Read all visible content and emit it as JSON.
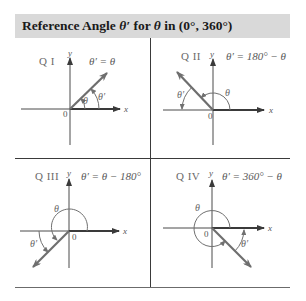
{
  "header": {
    "title_prefix": "Reference Angle ",
    "title_theta_prime": "θ′",
    "title_mid": " for ",
    "title_theta": "θ",
    "title_suffix": " in (0°, 360°)",
    "background": "#d9d9d9"
  },
  "panels": [
    {
      "id": "q1",
      "quadrant_label": "Q I",
      "formula": "θ′ = θ",
      "axis_x": "x",
      "axis_y": "y",
      "origin": "0",
      "angle_label": "θ",
      "ref_angle_label": "θ′"
    },
    {
      "id": "q2",
      "quadrant_label": "Q II",
      "formula": "θ′ = 180° − θ",
      "axis_x": "x",
      "axis_y": "y",
      "origin": "0",
      "angle_label": "θ",
      "ref_angle_label": "θ′"
    },
    {
      "id": "q3",
      "quadrant_label": "Q III",
      "formula": "θ′ = θ − 180°",
      "axis_x": "x",
      "axis_y": "y",
      "origin": "0",
      "angle_label": "θ",
      "ref_angle_label": "θ′"
    },
    {
      "id": "q4",
      "quadrant_label": "Q IV",
      "formula": "θ′ = 360° − θ",
      "axis_x": "x",
      "axis_y": "y",
      "origin": "0",
      "angle_label": "θ",
      "ref_angle_label": "θ′"
    }
  ],
  "colors": {
    "axis": "#4a4a4a",
    "ray": "#6e6e6e",
    "arc": "#707070",
    "divider": "#3a3a3a"
  }
}
